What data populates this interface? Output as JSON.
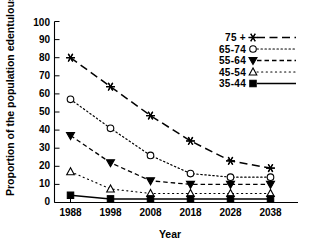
{
  "chart_data": {
    "type": "line",
    "title": "",
    "xlabel": "Year",
    "ylabel": "Proportion of the population edentulous (%)",
    "categories": [
      "1988",
      "1998",
      "2008",
      "2018",
      "2028",
      "2038"
    ],
    "x": [
      1988,
      1998,
      2008,
      2018,
      2028,
      2038
    ],
    "xlim": [
      1983,
      2043
    ],
    "ylim": [
      0,
      100
    ],
    "ytick_labels": [
      "0",
      "10",
      "20",
      "30",
      "40",
      "50",
      "60",
      "70",
      "80",
      "90",
      "100"
    ],
    "ytick_values": [
      0,
      10,
      20,
      30,
      40,
      50,
      60,
      70,
      80,
      90,
      100
    ],
    "xtick_labels": [
      "1988",
      "1998",
      "2008",
      "2018",
      "2028",
      "2038"
    ],
    "grid": false,
    "legend_position": "top-right",
    "series": [
      {
        "name": "75 +",
        "values": [
          80,
          64,
          48,
          34,
          23,
          19
        ],
        "marker": "star",
        "linestyle": "long-dash",
        "color": "#000000"
      },
      {
        "name": "65-74",
        "values": [
          57,
          41,
          26,
          16,
          14,
          14
        ],
        "marker": "open-circle",
        "linestyle": "dotted",
        "color": "#000000"
      },
      {
        "name": "55-64",
        "values": [
          37,
          22,
          12,
          10,
          10,
          10
        ],
        "marker": "filled-down-triangle",
        "linestyle": "dashed",
        "color": "#000000"
      },
      {
        "name": "45-54",
        "values": [
          17,
          7.5,
          5,
          5,
          5,
          5
        ],
        "marker": "open-up-triangle",
        "linestyle": "fine-dotted",
        "color": "#000000"
      },
      {
        "name": "35-44",
        "values": [
          4,
          2,
          2,
          2,
          2,
          2
        ],
        "marker": "filled-square",
        "linestyle": "solid",
        "color": "#000000"
      }
    ]
  },
  "legend": {
    "entries": [
      {
        "label": "75 +"
      },
      {
        "label": "65-74"
      },
      {
        "label": "55-64"
      },
      {
        "label": "45-54"
      },
      {
        "label": "35-44"
      }
    ]
  },
  "axes": {
    "y_title": "Proportion of the population edentulous (%)",
    "x_title": "Year"
  }
}
